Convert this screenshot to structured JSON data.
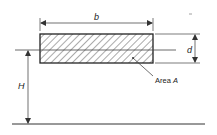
{
  "diagram": {
    "type": "engineering-cross-section",
    "labels": {
      "width": "b",
      "depth": "d",
      "height": "H",
      "area_prefix": "Area ",
      "area_symbol": "A"
    },
    "colors": {
      "line": "#222222",
      "hatch": "#555555",
      "dim": "#333333"
    }
  }
}
